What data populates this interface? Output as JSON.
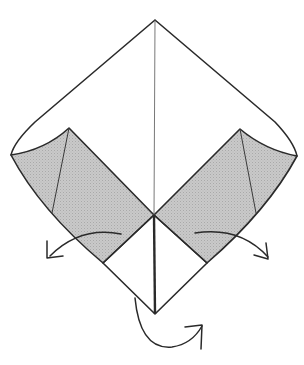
{
  "diagram": {
    "type": "origami-folding-step",
    "colors": {
      "paper": "#ffffff",
      "shaded_flap": "#c4c4c4",
      "line": "#2a2a2a"
    },
    "points": {
      "top_apex": [
        155,
        20
      ],
      "left_corner": [
        11,
        155
      ],
      "right_corner": [
        297,
        156
      ],
      "bottom_point": [
        155,
        314
      ],
      "center_junction": [
        154,
        215
      ],
      "left_flap_tip": [
        69,
        128
      ],
      "right_flap_tip": [
        240,
        129
      ],
      "left_shade_bottom": [
        103,
        263
      ],
      "right_shade_bottom": [
        207,
        263
      ]
    },
    "arrows": [
      {
        "name": "left-flap-fold-arrow",
        "direction": "down-left"
      },
      {
        "name": "right-flap-fold-arrow",
        "direction": "down-right"
      },
      {
        "name": "bottom-turn-over-arrow",
        "direction": "under-and-up-right"
      }
    ]
  }
}
